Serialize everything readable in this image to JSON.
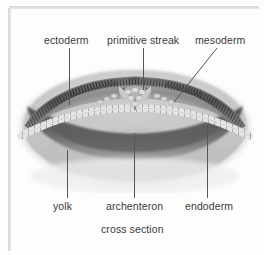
{
  "figure": {
    "caption": "cross section",
    "background_color": "#fdfdfd",
    "label_color": "#3a3a3a",
    "leader_color": "#565656"
  },
  "labels": {
    "top": [
      {
        "id": "ectoderm",
        "text": "ectoderm"
      },
      {
        "id": "primitive-streak",
        "text": "primitive streak"
      },
      {
        "id": "mesoderm",
        "text": "mesoderm"
      }
    ],
    "bottom": [
      {
        "id": "yolk",
        "text": "yolk"
      },
      {
        "id": "archenteron",
        "text": "archenteron"
      },
      {
        "id": "endoderm",
        "text": "endoderm"
      }
    ]
  },
  "illustration": {
    "name": "embryo-cross-section",
    "layers": [
      {
        "name": "ectoderm",
        "description": "striated columnar cell layer along upper surface",
        "color": "#5e5e5e"
      },
      {
        "name": "mesoderm",
        "description": "mid layer wedge beneath ectoderm",
        "color": "#8c8c8c"
      },
      {
        "name": "endoderm",
        "description": "beaded cell row lining archenteron roof",
        "color": "#dedede"
      },
      {
        "name": "archenteron",
        "description": "dark cavity below the germ layers",
        "color": "#6b6b6b"
      },
      {
        "name": "yolk",
        "description": "large pale granular mass filling lower region",
        "color": "#c9c9c9"
      }
    ]
  }
}
